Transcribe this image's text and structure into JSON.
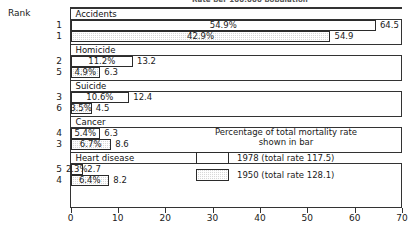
{
  "supertitle": "Rate per 100,000 population",
  "rank_header": "Rank",
  "legend": {
    "title_line1": "Percentage of total mortality rate",
    "title_line2": "shown in bar",
    "entries": [
      {
        "key": "y1978",
        "label": "1978 (total rate 117.5)"
      },
      {
        "key": "y1950",
        "label": "1950 (total rate 128.1)"
      }
    ]
  },
  "chart_data": {
    "type": "bar",
    "title": "Rate per 100,000 population",
    "xlabel": "",
    "ylabel": "",
    "xlim": [
      0,
      70
    ],
    "xticks": [
      "0",
      "10",
      "20",
      "30",
      "40",
      "50",
      "60",
      "70"
    ],
    "grid": false,
    "legend_position": "inside-right",
    "orientation": "horizontal",
    "categories": [
      "Accidents",
      "Homicide",
      "Suicide",
      "Cancer",
      "Heart disease"
    ],
    "series": [
      {
        "name": "1978 (total rate 117.5)",
        "values": [
          64.5,
          13.2,
          12.4,
          6.3,
          2.7
        ],
        "percent_labels": [
          "54.9%",
          "11.2%",
          "10.6%",
          "5.4%",
          "2.3%"
        ],
        "ranks": [
          "1",
          "2",
          "3",
          "4",
          "5"
        ]
      },
      {
        "name": "1950 (total rate 128.1)",
        "values": [
          54.9,
          6.3,
          4.5,
          8.6,
          8.2
        ],
        "percent_labels": [
          "42.9%",
          "4.9%",
          "3.5%",
          "6.7%",
          "6.4%"
        ],
        "ranks": [
          "1",
          "5",
          "6",
          "3",
          "4"
        ]
      }
    ],
    "rows": [
      {
        "category": "Accidents",
        "rank": "1",
        "series": "1978 (total rate 117.5)",
        "percent": "54.9%",
        "value": "64.5"
      },
      {
        "category": "Accidents",
        "rank": "1",
        "series": "1950 (total rate 128.1)",
        "percent": "42.9%",
        "value": "54.9"
      },
      {
        "category": "Homicide",
        "rank": "2",
        "series": "1978 (total rate 117.5)",
        "percent": "11.2%",
        "value": "13.2"
      },
      {
        "category": "Homicide",
        "rank": "5",
        "series": "1950 (total rate 128.1)",
        "percent": "4.9%",
        "value": "6.3"
      },
      {
        "category": "Suicide",
        "rank": "3",
        "series": "1978 (total rate 117.5)",
        "percent": "10.6%",
        "value": "12.4"
      },
      {
        "category": "Suicide",
        "rank": "6",
        "series": "1950 (total rate 128.1)",
        "percent": "3.5%",
        "value": "4.5"
      },
      {
        "category": "Cancer",
        "rank": "4",
        "series": "1978 (total rate 117.5)",
        "percent": "5.4%",
        "value": "6.3"
      },
      {
        "category": "Cancer",
        "rank": "3",
        "series": "1950 (total rate 128.1)",
        "percent": "6.7%",
        "value": "8.6"
      },
      {
        "category": "Heart disease",
        "rank": "5",
        "series": "1978 (total rate 117.5)",
        "percent": "2.3%",
        "value": "2.7"
      },
      {
        "category": "Heart disease",
        "rank": "4",
        "series": "1950 (total rate 128.1)",
        "percent": "6.4%",
        "value": "8.2"
      }
    ]
  }
}
